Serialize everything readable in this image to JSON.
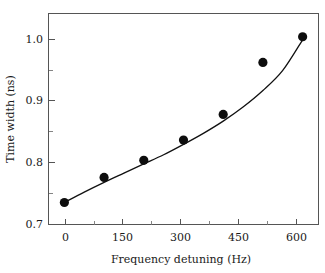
{
  "chart_data": {
    "type": "scatter",
    "title": "",
    "subtitle": "",
    "xlabel": "Frequency detuning (Hz)",
    "ylabel": "Time width (ns)",
    "xlim": [
      -40,
      640
    ],
    "ylim": [
      0.7,
      1.045
    ],
    "xticks": [
      0,
      150,
      300,
      450,
      600
    ],
    "xtick_labels": [
      "0",
      "150",
      "300",
      "450",
      "600"
    ],
    "x_minor_ticks": [
      75,
      225,
      375,
      525
    ],
    "yticks": [
      0.7,
      0.8,
      0.9,
      1.0
    ],
    "ytick_labels": [
      "0.7",
      "0.8",
      "0.9",
      "1.0"
    ],
    "y_minor_ticks": [
      0.75,
      0.85,
      0.95,
      1.0
    ],
    "grid": false,
    "legend": null,
    "marker": "filled-circle",
    "marker_color": "#0d0d0d",
    "line_color": "#111111",
    "x": [
      0,
      100,
      200,
      300,
      400,
      500,
      600
    ],
    "values": [
      0.736,
      0.777,
      0.805,
      0.838,
      0.88,
      0.965,
      1.007
    ],
    "series": [
      {
        "name": "Time width measurement",
        "x": [
          0,
          100,
          200,
          300,
          400,
          500,
          600
        ],
        "values": [
          0.736,
          0.777,
          0.805,
          0.838,
          0.88,
          0.965,
          1.007
        ]
      },
      {
        "name": "fit curve",
        "type": "line",
        "x": [
          0,
          50,
          100,
          150,
          200,
          250,
          300,
          350,
          400,
          450,
          500,
          550,
          600
        ],
        "values": [
          0.736,
          0.753,
          0.769,
          0.784,
          0.799,
          0.814,
          0.831,
          0.849,
          0.869,
          0.892,
          0.919,
          0.952,
          1.002
        ]
      }
    ],
    "annotations": []
  },
  "axes": {
    "x_title": "Frequency detuning (Hz)",
    "y_title": "Time width (ns)"
  }
}
